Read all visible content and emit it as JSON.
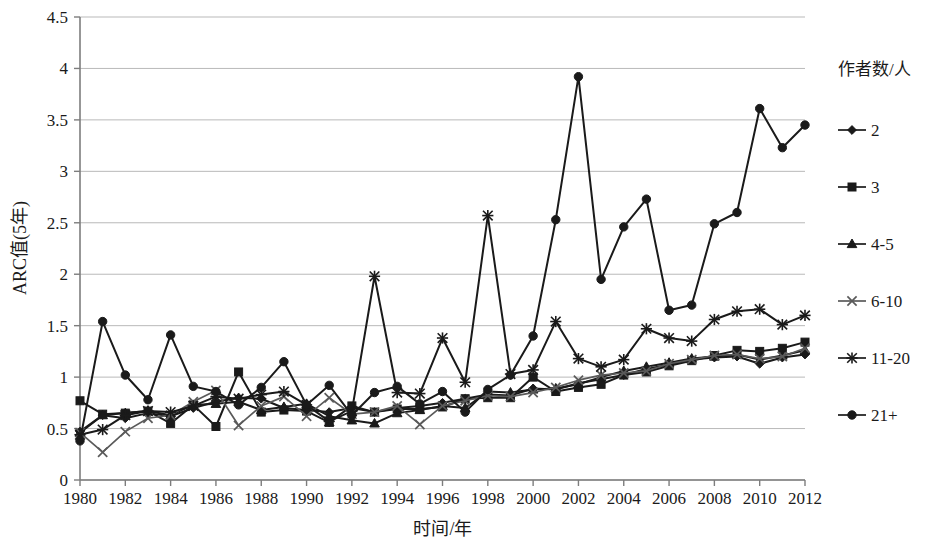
{
  "chart_data": {
    "type": "line",
    "title": "",
    "xlabel": "时间/年",
    "ylabel": "ARC值(5年)",
    "xlim": [
      1980,
      2012
    ],
    "ylim": [
      0,
      4.5
    ],
    "ytick_step": 0.5,
    "xtick_step": 2,
    "grid": "horizontal",
    "legend_position": "right",
    "legend_title": "作者数/人",
    "x": [
      1980,
      1981,
      1982,
      1983,
      1984,
      1985,
      1986,
      1987,
      1988,
      1989,
      1990,
      1991,
      1992,
      1993,
      1994,
      1995,
      1996,
      1997,
      1998,
      1999,
      2000,
      2001,
      2002,
      2003,
      2004,
      2005,
      2006,
      2007,
      2008,
      2009,
      2010,
      2011,
      2012
    ],
    "ytick_labels": [
      "0",
      "0.5",
      "1",
      "1.5",
      "2",
      "2.5",
      "3",
      "3.5",
      "4",
      "4.5"
    ],
    "ytick_values": [
      0,
      0.5,
      1,
      1.5,
      2,
      2.5,
      3,
      3.5,
      4,
      4.5
    ],
    "xtick_labels": [
      "1980",
      "1982",
      "1984",
      "1986",
      "1988",
      "1990",
      "1992",
      "1994",
      "1996",
      "1998",
      "2000",
      "2002",
      "2004",
      "2006",
      "2008",
      "2010",
      "2012"
    ],
    "xtick_values": [
      1980,
      1982,
      1984,
      1986,
      1988,
      1990,
      1992,
      1994,
      1996,
      1998,
      2000,
      2002,
      2004,
      2006,
      2008,
      2010,
      2012
    ],
    "series": [
      {
        "name": "2",
        "marker": "diamond",
        "color": "#1a1a1a",
        "values": [
          0.47,
          0.63,
          0.6,
          0.65,
          0.62,
          0.7,
          0.76,
          0.8,
          0.79,
          0.7,
          0.68,
          0.66,
          0.7,
          0.66,
          0.7,
          0.72,
          0.75,
          0.79,
          0.83,
          0.82,
          0.89,
          0.88,
          0.94,
          0.98,
          1.02,
          1.08,
          1.12,
          1.17,
          1.19,
          1.2,
          1.13,
          1.19,
          1.22
        ]
      },
      {
        "name": "3",
        "marker": "square",
        "color": "#1a1a1a",
        "values": [
          0.77,
          0.64,
          0.65,
          0.67,
          0.55,
          0.73,
          0.52,
          1.05,
          0.66,
          0.68,
          0.67,
          0.56,
          0.72,
          0.66,
          0.69,
          0.69,
          0.71,
          0.79,
          0.8,
          0.8,
          1.0,
          0.86,
          0.9,
          0.93,
          1.02,
          1.05,
          1.11,
          1.16,
          1.21,
          1.26,
          1.25,
          1.28,
          1.34
        ]
      },
      {
        "name": "4-5",
        "marker": "triangle",
        "color": "#1a1a1a",
        "values": [
          0.46,
          0.63,
          0.65,
          0.67,
          0.63,
          0.73,
          0.74,
          0.76,
          0.68,
          0.71,
          0.74,
          0.62,
          0.58,
          0.55,
          0.65,
          0.68,
          0.72,
          0.7,
          0.86,
          0.85,
          0.88,
          0.89,
          0.93,
          1.0,
          1.06,
          1.1,
          1.14,
          1.18,
          1.2,
          1.22,
          1.17,
          1.21,
          1.26
        ]
      },
      {
        "name": "6-10",
        "marker": "x",
        "color": "#5a5a5a",
        "values": [
          0.46,
          0.27,
          0.47,
          0.6,
          0.63,
          0.76,
          0.87,
          0.53,
          0.72,
          0.81,
          0.62,
          0.8,
          0.64,
          0.66,
          0.72,
          0.54,
          0.72,
          0.77,
          0.82,
          0.81,
          0.85,
          0.9,
          0.97,
          1.02,
          1.04,
          1.06,
          1.13,
          1.17,
          1.21,
          1.22,
          1.18,
          1.2,
          1.28
        ]
      },
      {
        "name": "11-20",
        "marker": "asterisk",
        "color": "#1a1a1a",
        "values": [
          0.44,
          0.49,
          0.63,
          0.67,
          0.66,
          0.72,
          0.81,
          0.79,
          0.83,
          0.86,
          0.73,
          0.57,
          0.67,
          1.98,
          0.85,
          0.84,
          1.38,
          0.95,
          2.57,
          1.03,
          1.07,
          1.54,
          1.18,
          1.1,
          1.17,
          1.47,
          1.38,
          1.35,
          1.56,
          1.64,
          1.66,
          1.51,
          1.6
        ]
      },
      {
        "name": "21+",
        "marker": "circle",
        "color": "#1a1a1a",
        "values": [
          0.38,
          1.54,
          1.02,
          0.78,
          1.41,
          0.91,
          0.86,
          0.73,
          0.9,
          1.15,
          0.73,
          0.92,
          0.63,
          0.85,
          0.91,
          0.74,
          0.86,
          0.66,
          0.88,
          1.02,
          1.4,
          2.53,
          3.92,
          1.95,
          2.46,
          2.73,
          1.65,
          1.7,
          2.49,
          2.6,
          3.61,
          3.23,
          3.45
        ]
      }
    ]
  },
  "legend": {
    "title": "作者数/人",
    "items": [
      {
        "label": "2",
        "marker": "diamond"
      },
      {
        "label": "3",
        "marker": "square"
      },
      {
        "label": "4-5",
        "marker": "triangle"
      },
      {
        "label": "6-10",
        "marker": "x"
      },
      {
        "label": "11-20",
        "marker": "asterisk"
      },
      {
        "label": "21+",
        "marker": "circle"
      }
    ]
  }
}
